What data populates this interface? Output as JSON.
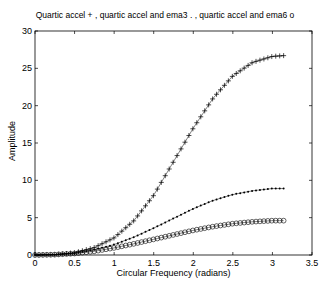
{
  "chart_data": {
    "type": "line",
    "title": "Quartic accel + , quartic accel and ema3 . , quartic accel and ema6  o",
    "xlabel": "Circular Frequency  (radians)",
    "ylabel": "Amplitude",
    "xlim": [
      0,
      3.5
    ],
    "ylim": [
      0,
      30
    ],
    "xticks": [
      0,
      0.5,
      1,
      1.5,
      2,
      2.5,
      3,
      3.5
    ],
    "xtick_labels": [
      "0",
      "0.5",
      "1",
      "1.5",
      "2",
      "2.5",
      "3",
      "3.5"
    ],
    "yticks": [
      0,
      5,
      10,
      15,
      20,
      25,
      30
    ],
    "ytick_labels": [
      "0",
      "5",
      "10",
      "15",
      "20",
      "25",
      "30"
    ],
    "grid": false,
    "legend": "in title",
    "x": [
      0,
      0.25,
      0.5,
      0.75,
      1.0,
      1.25,
      1.5,
      1.75,
      2.0,
      2.25,
      2.5,
      2.75,
      3.0,
      3.1416
    ],
    "series": [
      {
        "name": "quartic accel",
        "marker": "+",
        "values": [
          0,
          0.05,
          0.3,
          1.0,
          2.3,
          4.6,
          8.0,
          12.5,
          17.0,
          21.0,
          24.0,
          25.8,
          26.6,
          26.7
        ]
      },
      {
        "name": "quartic accel and ema3",
        "marker": ".",
        "values": [
          0,
          0.05,
          0.25,
          0.7,
          1.4,
          2.4,
          3.6,
          4.9,
          6.2,
          7.3,
          8.1,
          8.6,
          8.9,
          8.9
        ]
      },
      {
        "name": "quartic accel and ema6",
        "marker": "o",
        "values": [
          0,
          0.05,
          0.2,
          0.5,
          0.95,
          1.5,
          2.1,
          2.7,
          3.3,
          3.8,
          4.2,
          4.45,
          4.6,
          4.6
        ]
      }
    ]
  }
}
